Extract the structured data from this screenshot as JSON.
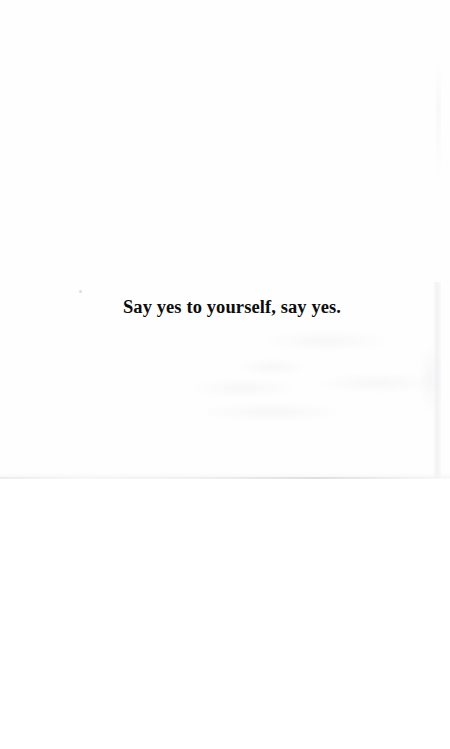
{
  "page": {
    "kind": "scanned-book-page",
    "background_color": "#ffffff",
    "paper_color": "#fefefe",
    "width_px": 450,
    "height_px": 749
  },
  "epigraph": {
    "text": "Say yes to yourself, say yes.",
    "text_color": "#0d0d0d",
    "alignment": "center"
  },
  "scan_artifacts": {
    "page_bottom_edge_color": "#e4e4e7",
    "page_right_edge_color": "#ebebee",
    "show_through_color": "#f0f0f3",
    "dust_speck_color": "#d6d6da"
  }
}
